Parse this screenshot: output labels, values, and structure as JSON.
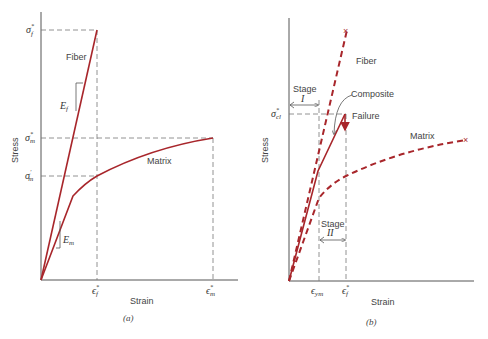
{
  "colors": {
    "curve": "#a8262b",
    "axis": "#555555",
    "guide": "#777777",
    "text": "#444444"
  },
  "panel_a": {
    "caption": "(a)",
    "xlabel": "Strain",
    "ylabel": "Stress",
    "fiber_label": "Fiber",
    "matrix_label": "Matrix",
    "ef_modulus": "E",
    "ef_sub": "f",
    "em_modulus": "E",
    "em_sub": "m",
    "y_ticks": {
      "sigma_f_star": {
        "base": "σ",
        "sub": "f",
        "sup": "*"
      },
      "sigma_m_star": {
        "base": "σ",
        "sub": "m",
        "sup": "*"
      },
      "sigma_m_prime": {
        "base": "σ",
        "sub": "m",
        "sup": "′"
      }
    },
    "x_ticks": {
      "eps_f_star": {
        "base": "ϵ",
        "sub": "f",
        "sup": "*"
      },
      "eps_m_star": {
        "base": "ϵ",
        "sub": "m",
        "sup": "*"
      }
    }
  },
  "panel_b": {
    "caption": "(b)",
    "xlabel": "Strain",
    "ylabel": "Stress",
    "fiber_label": "Fiber",
    "matrix_label": "Matrix",
    "composite_label": "Composite",
    "failure_label": "Failure",
    "stage1_label": "Stage",
    "stage1_num": "I",
    "stage2_label": "Stage",
    "stage2_num": "II",
    "y_ticks": {
      "sigma_cl_star": {
        "base": "σ",
        "sub": "cl",
        "sup": "*"
      }
    },
    "x_ticks": {
      "eps_ym": {
        "base": "ϵ",
        "sub": "ym"
      },
      "eps_f_star": {
        "base": "ϵ",
        "sub": "f",
        "sup": "*"
      }
    }
  }
}
